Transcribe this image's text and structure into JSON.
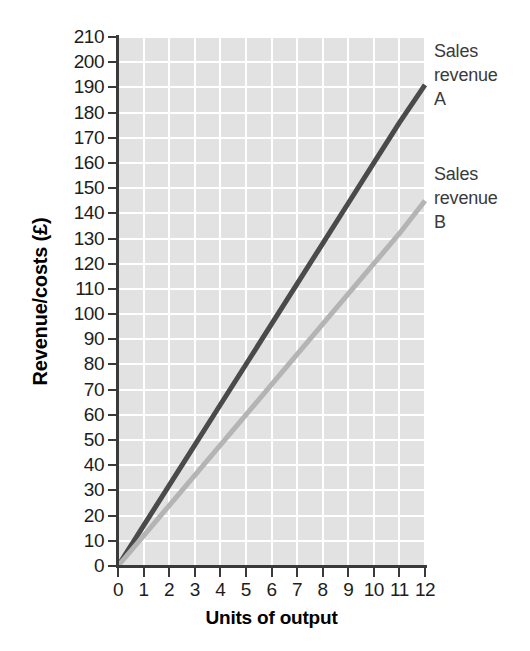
{
  "chart_data": {
    "type": "line",
    "title": "",
    "xlabel": "Units of output",
    "ylabel": "Revenue/costs (£)",
    "xlim": [
      0,
      12
    ],
    "ylim": [
      0,
      210
    ],
    "grid": true,
    "legend_position": "right-inline-annotations",
    "x": [
      0,
      1,
      2,
      3,
      4,
      5,
      6,
      7,
      8,
      9,
      10,
      11,
      12
    ],
    "xticks": [
      "0",
      "1",
      "2",
      "3",
      "4",
      "5",
      "6",
      "7",
      "8",
      "9",
      "10",
      "11",
      "12"
    ],
    "yticks": [
      "0",
      "10",
      "20",
      "30",
      "40",
      "50",
      "60",
      "70",
      "80",
      "90",
      "100",
      "110",
      "120",
      "130",
      "140",
      "150",
      "160",
      "170",
      "180",
      "190",
      "200",
      "210"
    ],
    "series": [
      {
        "name": "Sales revenue A",
        "annotation": "Sales\nrevenue\nA",
        "color": "#4a4a4a",
        "slope": 16,
        "values": [
          0,
          16,
          32,
          48,
          64,
          80,
          96,
          112,
          128,
          144,
          160,
          176,
          191
        ]
      },
      {
        "name": "Sales revenue B",
        "annotation": "Sales\nrevenue\nB",
        "color": "#b4b4b4",
        "slope": 12,
        "values": [
          0,
          12,
          24,
          36,
          48,
          60,
          72,
          84,
          96,
          108,
          120,
          132,
          145
        ]
      }
    ],
    "colors": {
      "plot_background": "#e2e2e2",
      "gridline": "#ffffff",
      "axis": "#3a3a3a",
      "series_a": "#4a4a4a",
      "series_b": "#b4b4b4",
      "text": "#1d1d1d"
    }
  }
}
